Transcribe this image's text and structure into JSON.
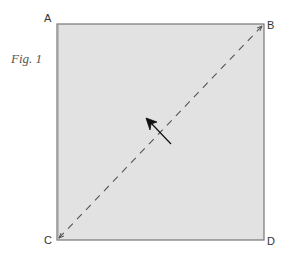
{
  "figure": {
    "caption": "Fig. 1",
    "fill_color": "#e2e2e2",
    "border_color": "#777777",
    "dash_color": "#555555",
    "arrow_color": "#111111"
  },
  "corners": {
    "top_left": "A",
    "top_right": "B",
    "bottom_left": "C",
    "bottom_right": "D"
  },
  "diagonal": {
    "from": "C",
    "to": "B",
    "style": "dashed"
  },
  "fold_arrow": {
    "direction": "up-left",
    "crosses": "diagonal"
  }
}
